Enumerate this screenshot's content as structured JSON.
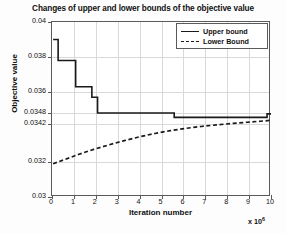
{
  "chart_data": {
    "type": "line",
    "title": "Changes of upper and lower bounds of the objective value",
    "xlabel": "Iteration number",
    "ylabel": "Objective value",
    "x_multiplier": "x 10",
    "x_multiplier_exponent": "6",
    "xlim": [
      0,
      10
    ],
    "ylim": [
      0.03,
      0.04
    ],
    "grid": true,
    "legend_position": "top-right",
    "xticks": [
      0,
      1,
      2,
      3,
      4,
      5,
      6,
      7,
      8,
      9,
      10
    ],
    "xtick_labels": [
      "0",
      "1",
      "2",
      "3",
      "4",
      "5",
      "6",
      "7",
      "8",
      "9",
      "10"
    ],
    "yticks": [
      0.03,
      0.032,
      0.0342,
      0.0348,
      0.036,
      0.038,
      0.04
    ],
    "ytick_labels": [
      "0.03",
      "0.032",
      "0.0342",
      "0.0348",
      "0.036",
      "0.038",
      "0.04"
    ],
    "series": [
      {
        "name": "Upper bound",
        "style": "solid",
        "color": "#1a1a1a",
        "points": [
          [
            0.05,
            0.039
          ],
          [
            0.28,
            0.039
          ],
          [
            0.28,
            0.0378
          ],
          [
            1.08,
            0.0378
          ],
          [
            1.08,
            0.0363
          ],
          [
            1.82,
            0.0363
          ],
          [
            1.82,
            0.0357
          ],
          [
            2.08,
            0.0357
          ],
          [
            2.08,
            0.0348
          ],
          [
            5.58,
            0.0348
          ],
          [
            5.58,
            0.03455
          ],
          [
            9.82,
            0.03455
          ],
          [
            9.82,
            0.03475
          ],
          [
            10.0,
            0.03475
          ]
        ]
      },
      {
        "name": "Lower Bound",
        "style": "dashed",
        "color": "#1a1a1a",
        "points": [
          [
            0.05,
            0.0319
          ],
          [
            0.6,
            0.03215
          ],
          [
            1.2,
            0.03243
          ],
          [
            1.9,
            0.03272
          ],
          [
            2.6,
            0.03298
          ],
          [
            3.3,
            0.03322
          ],
          [
            4.0,
            0.03344
          ],
          [
            4.7,
            0.03363
          ],
          [
            5.4,
            0.03379
          ],
          [
            6.1,
            0.03392
          ],
          [
            6.8,
            0.03403
          ],
          [
            7.5,
            0.03412
          ],
          [
            8.2,
            0.0342
          ],
          [
            8.9,
            0.03427
          ],
          [
            9.5,
            0.03433
          ],
          [
            10.0,
            0.03438
          ]
        ]
      }
    ]
  },
  "legend": {
    "items": [
      {
        "label": "Upper bound"
      },
      {
        "label": "Lower Bound"
      }
    ]
  }
}
